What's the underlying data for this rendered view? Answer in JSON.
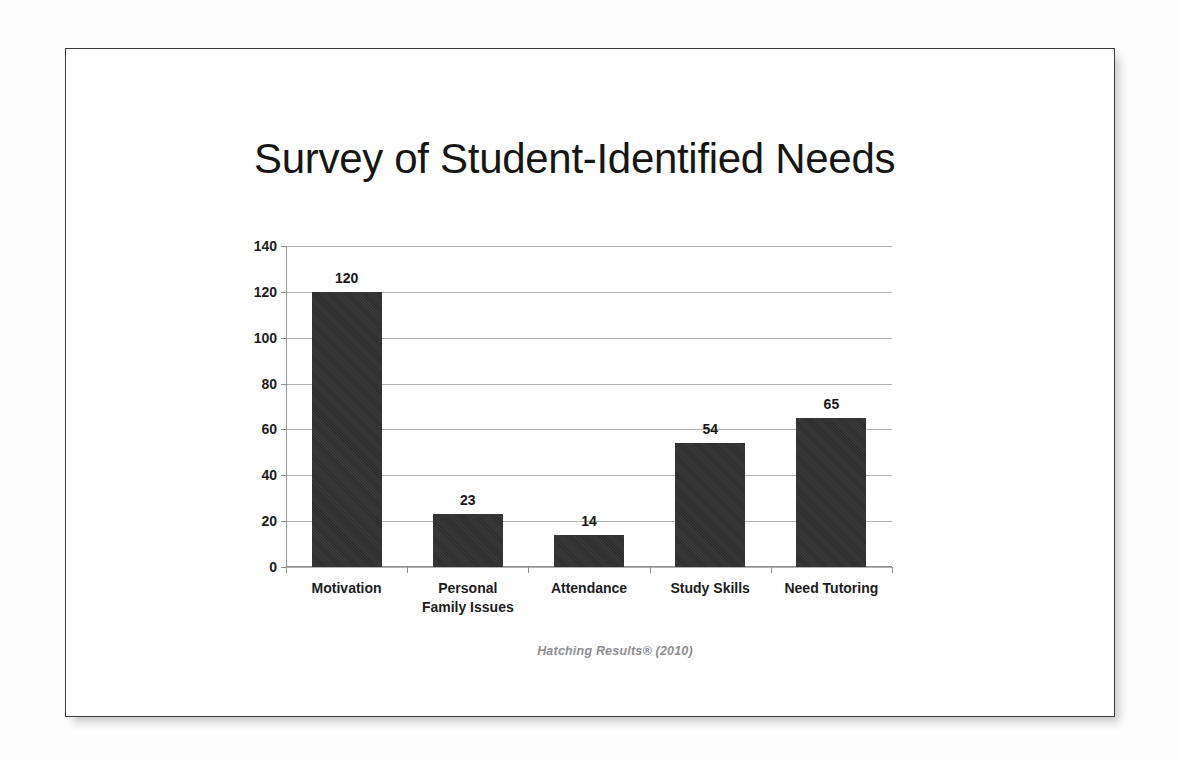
{
  "slide": {
    "title": "Survey of Student-Identified Needs",
    "attribution": "Hatching Results®  (2010)"
  },
  "colors": {
    "bar": "#2e2e2e",
    "title_text": "#161616",
    "gridline": "#b2b2b2",
    "axis": "#8f8f8f",
    "attribution_text": "#8e8e92",
    "slide_border": "#3a3a3c",
    "slide_background": "#ffffff"
  },
  "chart_data": {
    "type": "bar",
    "title": "Survey of Student-Identified Needs",
    "categories": [
      "Motivation",
      "Personal\nFamily Issues",
      "Attendance",
      "Study Skills",
      "Need Tutoring"
    ],
    "category_lines": [
      [
        "Motivation"
      ],
      [
        "Personal",
        "Family Issues"
      ],
      [
        "Attendance"
      ],
      [
        "Study Skills"
      ],
      [
        "Need Tutoring"
      ]
    ],
    "values": [
      120,
      23,
      14,
      54,
      65
    ],
    "data_labels": [
      "120",
      "23",
      "14",
      "54",
      "65"
    ],
    "xlabel": "",
    "ylabel": "",
    "ylim": [
      0,
      140
    ],
    "yticks": [
      0,
      20,
      40,
      60,
      80,
      100,
      120,
      140
    ],
    "ytick_labels": [
      "0",
      "20",
      "40",
      "60",
      "80",
      "100",
      "120",
      "140"
    ],
    "grid": true,
    "legend": false,
    "annotations": [
      "Hatching Results®  (2010)"
    ]
  }
}
